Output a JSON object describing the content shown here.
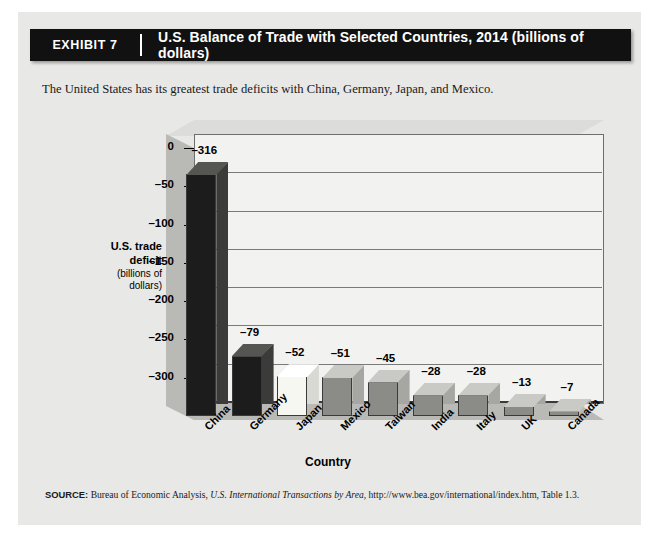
{
  "header": {
    "exhibit_label": "EXHIBIT 7",
    "title": "U.S. Balance of Trade with Selected Countries, 2014 (billions of dollars)"
  },
  "subtitle": "The United States has its greatest trade deficits with China, Germany, Japan, and Mexico.",
  "source": {
    "label": "SOURCE:",
    "text_before": " Bureau of Economic Analysis, ",
    "italic": "U.S. International Transactions by Area",
    "text_after": ", http://www.bea.gov/international/index.htm, Table 1.3."
  },
  "y_axis_title": {
    "line1": "U.S. trade",
    "line2": "deficit",
    "line3": "(billions of",
    "line4": "dollars)"
  },
  "colors": {
    "header_bg": "#111111",
    "panel_bg": "#e8e8e6",
    "plot_bg": "#f2f2f0",
    "wall_gray": "#b9b9b6",
    "bar_dark": "#1c1c1c",
    "bar_light": "#f7f7f2",
    "bar_medium": "#8b8b88",
    "axis": "#3a3a3a"
  },
  "chart_data": {
    "type": "bar",
    "title": "U.S. Balance of Trade with Selected Countries, 2014 (billions of dollars)",
    "xlabel": "Country",
    "ylabel": "U.S. trade deficit (billions of dollars)",
    "categories": [
      "China",
      "Germany",
      "Japan",
      "Mexico",
      "Taiwan",
      "India",
      "Italy",
      "UK",
      "Canada"
    ],
    "values": [
      -316,
      -79,
      -52,
      -51,
      -45,
      -28,
      -28,
      -13,
      -7
    ],
    "value_labels": [
      "–316",
      "–79",
      "–52",
      "–51",
      "–45",
      "–28",
      "–28",
      "–13",
      "–7"
    ],
    "bar_shades": [
      "dark",
      "dark",
      "light",
      "medium",
      "medium",
      "medium",
      "medium",
      "medium",
      "medium"
    ],
    "ylim": [
      -350,
      0
    ],
    "ytick_values": [
      -300,
      -250,
      -200,
      -150,
      -100,
      -50,
      0
    ],
    "ytick_labels": [
      "–300",
      "–250",
      "–200",
      "–150",
      "–100",
      "–50",
      "0"
    ],
    "grid": true,
    "legend": "none",
    "three_d": true,
    "units": "billions of dollars",
    "year": 2014
  }
}
